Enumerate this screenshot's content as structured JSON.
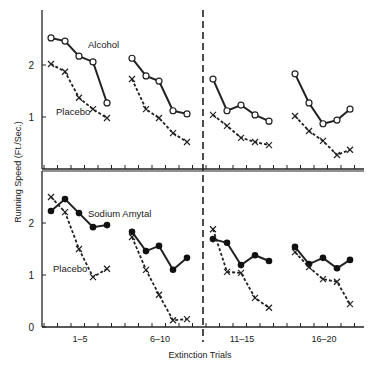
{
  "chart_data": {
    "type": "line",
    "title": "",
    "xlabel": "Extinction Trials",
    "ylabel": "Running Speed (Ft./Sec.)",
    "x_group_labels": [
      "1–5",
      "6–10",
      "11–15",
      "16–20"
    ],
    "ylim": [
      0,
      3
    ],
    "y_ticks": [
      0,
      1,
      2
    ],
    "grid": false,
    "legend_position": "inline labels",
    "divider": "dashed vertical line between trials 10 and 11",
    "panels": [
      {
        "name": "top",
        "series": [
          {
            "name": "Alcohol",
            "marker": "open-circle",
            "line": "solid",
            "groups": [
              [
                2.52,
                2.46,
                2.17,
                2.06,
                1.27
              ],
              [
                2.13,
                1.79,
                1.69,
                1.12,
                1.06
              ],
              [
                1.73,
                1.12,
                1.23,
                1.04,
                0.92
              ],
              [
                1.83,
                1.27,
                0.87,
                0.94,
                1.15
              ]
            ]
          },
          {
            "name": "Placebo",
            "marker": "x",
            "line": "dashed",
            "groups": [
              [
                2.02,
                1.87,
                1.37,
                1.15,
                0.98
              ],
              [
                1.73,
                1.15,
                0.98,
                0.69,
                0.52
              ],
              [
                1.04,
                0.83,
                0.6,
                0.52,
                0.46
              ],
              [
                1.02,
                0.73,
                0.54,
                0.27,
                0.37
              ]
            ]
          }
        ],
        "labels": [
          {
            "text": "Alcohol",
            "x": 88,
            "y": 48
          },
          {
            "text": "Placebo",
            "x": 56,
            "y": 115
          }
        ]
      },
      {
        "name": "bottom",
        "series": [
          {
            "name": "Sodium Amytal",
            "marker": "filled-circle",
            "line": "solid",
            "groups": [
              [
                2.23,
                2.46,
                2.19,
                1.92,
                1.96
              ],
              [
                1.83,
                1.46,
                1.56,
                1.1,
                1.33
              ],
              [
                1.69,
                1.62,
                1.19,
                1.38,
                1.27
              ],
              [
                1.54,
                1.21,
                1.33,
                1.13,
                1.29
              ]
            ]
          },
          {
            "name": "Placebo",
            "marker": "x",
            "line": "dashed",
            "groups": [
              [
                2.5,
                2.21,
                1.5,
                0.96,
                1.12
              ],
              [
                1.73,
                1.1,
                0.62,
                0.13,
                0.15
              ],
              [
                1.88,
                1.06,
                1.04,
                0.56,
                0.37
              ],
              [
                1.44,
                1.15,
                0.92,
                0.87,
                0.44
              ]
            ]
          }
        ],
        "labels": [
          {
            "text": "Sodium Amytal",
            "x": 88,
            "y": 217
          },
          {
            "text": "Placebo",
            "x": 53,
            "y": 272
          }
        ]
      }
    ]
  }
}
